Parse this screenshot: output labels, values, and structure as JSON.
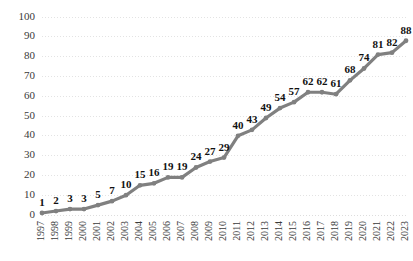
{
  "chart_data": {
    "type": "line",
    "title": "",
    "subtitle": "",
    "xlabel": "",
    "ylabel": "",
    "categories": [
      "1997",
      "1998",
      "1999",
      "2000",
      "2001",
      "2002",
      "2003",
      "2004",
      "2005",
      "2006",
      "2007",
      "2008",
      "2009",
      "2010",
      "2011",
      "2012",
      "2013",
      "2014",
      "2015",
      "2016",
      "2017",
      "2018",
      "2019",
      "2020",
      "2021",
      "2022",
      "2023"
    ],
    "values": [
      1,
      2,
      3,
      3,
      5,
      7,
      10,
      15,
      16,
      19,
      19,
      24,
      27,
      29,
      40,
      43,
      49,
      54,
      57,
      62,
      62,
      61,
      68,
      74,
      81,
      82,
      88
    ],
    "ylim": [
      0,
      100
    ],
    "ytick_labels": [
      "0",
      "10",
      "20",
      "30",
      "40",
      "50",
      "60",
      "70",
      "80",
      "90",
      "100"
    ],
    "ytick_values": [
      0,
      10,
      20,
      30,
      40,
      50,
      60,
      70,
      80,
      90,
      100
    ],
    "grid": true,
    "grid_orientation": "horizontal",
    "legend": false,
    "legend_position": "none",
    "data_labels": true,
    "markers": true,
    "series_color": "#808080",
    "grid_color": "#d9d9d9",
    "label_color": "#111111",
    "tick_color": "#3a3a3a",
    "background_color": "#ffffff",
    "xtick_rotation": -90
  }
}
